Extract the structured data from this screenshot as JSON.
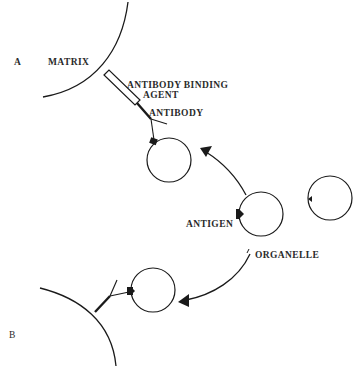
{
  "diagram": {
    "panel_labels": {
      "a": "A",
      "b": "B"
    },
    "labels": {
      "matrix": "MATRIX",
      "binding_agent_line1": "ANTIBODY  BINDING",
      "binding_agent_line2": "AGENT",
      "antibody": "ANTIBODY",
      "antigen": "ANTIGEN",
      "organelle": "ORGANELLE"
    },
    "caption": "",
    "colors": {
      "line": "#1a1a1a",
      "text": "#2a2a2a",
      "background": "#ffffff"
    }
  }
}
